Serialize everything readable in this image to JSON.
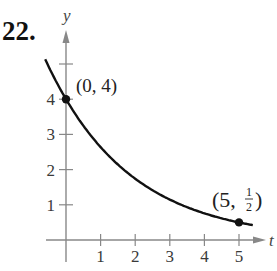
{
  "problem_number": "22.",
  "chart_data": {
    "type": "line",
    "title": "22.",
    "xlabel": "t",
    "ylabel": "y",
    "x_ticks": [
      1,
      2,
      3,
      4,
      5
    ],
    "x_tick_labels": [
      "1",
      "2",
      "3",
      "4",
      "5"
    ],
    "y_ticks": [
      1,
      2,
      3,
      4,
      5
    ],
    "y_tick_labels": [
      "1",
      "2",
      "3",
      "4",
      ""
    ],
    "xlim": [
      -0.6,
      5.6
    ],
    "ylim": [
      -0.6,
      5.9
    ],
    "grid": false,
    "series": [
      {
        "name": "y = 4(1/2)^(3t/5)",
        "x": [
          -0.6,
          0,
          1,
          2,
          3,
          4,
          5,
          5.4
        ],
        "y": [
          5.13,
          4,
          2.64,
          1.74,
          1.15,
          0.76,
          0.5,
          0.42
        ]
      }
    ],
    "points": [
      {
        "x": 0,
        "y": 4,
        "label": "(0, 4)"
      },
      {
        "x": 5,
        "y": 0.5,
        "label": "(5, 1/2)"
      }
    ]
  },
  "annotations": {
    "p1": "(0, 4)",
    "p2_open": "(5,",
    "p2_num": "1",
    "p2_den": "2",
    "p2_close": ")"
  }
}
